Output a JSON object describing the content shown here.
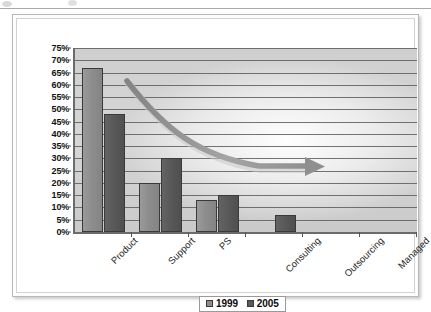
{
  "frame": {
    "artifact_top_line": true
  },
  "chart_data": {
    "type": "bar",
    "title": "",
    "xlabel": "",
    "ylabel": "",
    "categories": [
      "Product",
      "Support",
      "PS",
      "Consulting",
      "Outsourcing",
      "Managed"
    ],
    "series": [
      {
        "name": "1999",
        "color": "#8d8d8d",
        "values": [
          67,
          20,
          13,
          0,
          0,
          0
        ]
      },
      {
        "name": "2005",
        "color": "#595959",
        "values": [
          48,
          30,
          15,
          7,
          0,
          0
        ]
      }
    ],
    "ylim": [
      0,
      75
    ],
    "ytick_step": 5,
    "ytick_labels": [
      "0%",
      "5%",
      "10%",
      "15%",
      "20%",
      "25%",
      "30%",
      "35%",
      "40%",
      "45%",
      "50%",
      "55%",
      "60%",
      "65%",
      "70%",
      "75%"
    ],
    "grid": true,
    "legend_position": "bottom",
    "annotations": [
      {
        "kind": "curved-arrow",
        "color": "#9d9d9d",
        "start_value": 61,
        "end_value": 30,
        "direction": "decreasing-then-flat"
      }
    ]
  },
  "legend": {
    "entries": [
      {
        "label": "1999",
        "color": "#8d8d8d"
      },
      {
        "label": "2005",
        "color": "#595959"
      }
    ]
  },
  "colors": {
    "series_1999": "#8d8d8d",
    "series_2005": "#595959",
    "gridline": "#5c5c5c",
    "axis": "#6b6b6b",
    "plot_background": "#d2d2d2",
    "arrow": "#9d9d9d"
  }
}
